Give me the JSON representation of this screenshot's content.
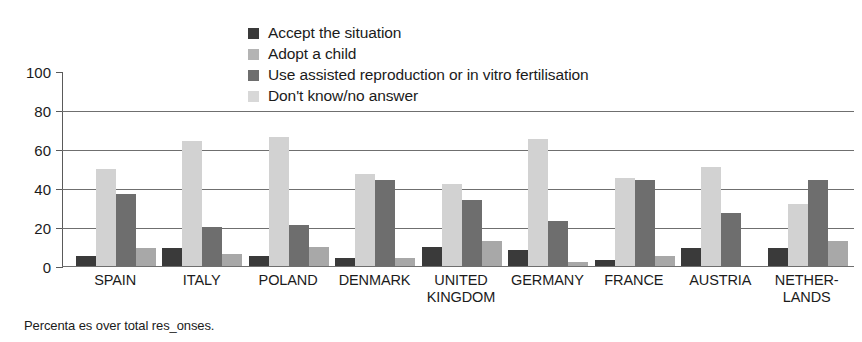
{
  "chart_data": {
    "type": "bar",
    "title": "",
    "xlabel": "",
    "ylabel": "",
    "ylim": [
      0,
      100
    ],
    "yticks": [
      0,
      20,
      40,
      60,
      80,
      100
    ],
    "grid": true,
    "legend_position": "top-center",
    "footnote": "Percenta es over total res_onses.",
    "categories": [
      "SPAIN",
      "ITALY",
      "POLAND",
      "DENMARK",
      "UNITED KINGDOM",
      "GERMANY",
      "FRANCE",
      "AUSTRIA",
      "NETHERLANDS"
    ],
    "category_lines": [
      [
        "SPAIN",
        ""
      ],
      [
        "ITALY",
        ""
      ],
      [
        "POLAND",
        ""
      ],
      [
        "DENMARK",
        ""
      ],
      [
        "UNITED",
        "KINGDOM"
      ],
      [
        "GERMANY",
        ""
      ],
      [
        "FRANCE",
        ""
      ],
      [
        "AUSTRIA",
        ""
      ],
      [
        "NETHER-",
        "LANDS"
      ]
    ],
    "series": [
      {
        "name": "Accept the situation",
        "color": "#3a3a3a",
        "values": [
          5,
          9,
          5,
          4,
          10,
          8,
          3,
          9,
          9
        ]
      },
      {
        "name": "Adopt a child",
        "color": "#d2d2d2",
        "values": [
          50,
          64,
          66,
          47,
          42,
          65,
          45,
          51,
          32
        ]
      },
      {
        "name": "Use assisted reproduction or in vitro fertilisation",
        "color": "#6e6e6e",
        "values": [
          37,
          20,
          21,
          44,
          34,
          23,
          44,
          27,
          44
        ]
      },
      {
        "name": "Don't know/no answer",
        "color": "#a8a8a8",
        "values": [
          9,
          6,
          10,
          4,
          13,
          2,
          5,
          0,
          13
        ]
      }
    ],
    "legend": [
      {
        "label": "Accept the situation",
        "swatch": "#3a3a3a"
      },
      {
        "label": "Adopt a child",
        "swatch": "#b4b4b4"
      },
      {
        "label": "Use assisted reproduction or in vitro fertilisation",
        "swatch": "#6e6e6e"
      },
      {
        "label": "Don't know/no answer",
        "swatch": "#d8d8d8"
      }
    ]
  }
}
